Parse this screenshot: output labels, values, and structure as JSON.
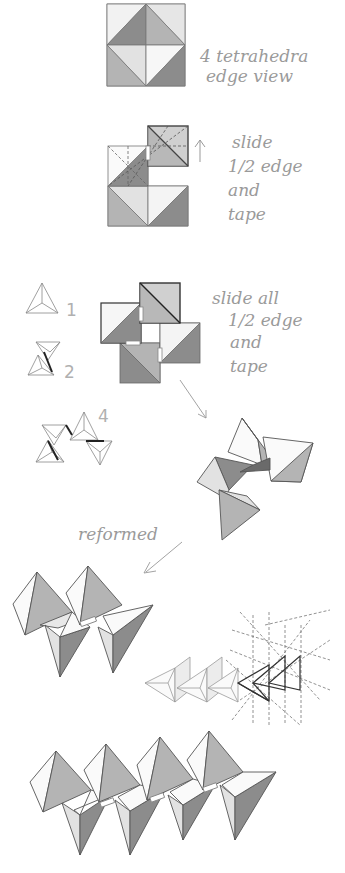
{
  "colors": {
    "dark": "#8c8c8c",
    "mid": "#b4b4b4",
    "light": "#e2e2e2",
    "white": "#fafafa",
    "line": "#555555",
    "thin": "#9a9a9a",
    "dash": "#777777",
    "label": "#9a9a9a"
  },
  "steps": [
    {
      "id": "edge-view",
      "caption_lines": [
        "4 tetrahedra",
        "edge view"
      ]
    },
    {
      "id": "slide-half-edge",
      "caption_lines": [
        "slide",
        "1/2 edge",
        "and",
        "tape"
      ],
      "arrow": "up-arrow"
    },
    {
      "id": "slide-all",
      "caption_lines": [
        "slide all",
        "1/2 edge",
        "and",
        "tape"
      ]
    },
    {
      "id": "count-legend",
      "labels": [
        "1",
        "2",
        "4"
      ]
    },
    {
      "id": "reformed",
      "caption_lines": [
        "reformed"
      ]
    }
  ]
}
